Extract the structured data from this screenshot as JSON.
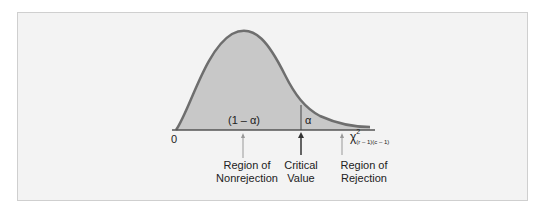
{
  "diagram": {
    "area_nonrejection": "(1 – α)",
    "area_rejection": "α",
    "origin_label": "0",
    "axis_label": "χ",
    "axis_sup": "2",
    "axis_sub": "(r – 1)(c – 1)",
    "labels": {
      "nonrejection_line1": "Region of",
      "nonrejection_line2": "Nonrejection",
      "critical_line1": "Critical",
      "critical_line2": "Value",
      "rejection_line1": "Region of",
      "rejection_line2": "Rejection"
    },
    "colors": {
      "fill": "#c8c8c8",
      "curve": "#6e6e6e",
      "background": "#f3f3f3"
    }
  }
}
